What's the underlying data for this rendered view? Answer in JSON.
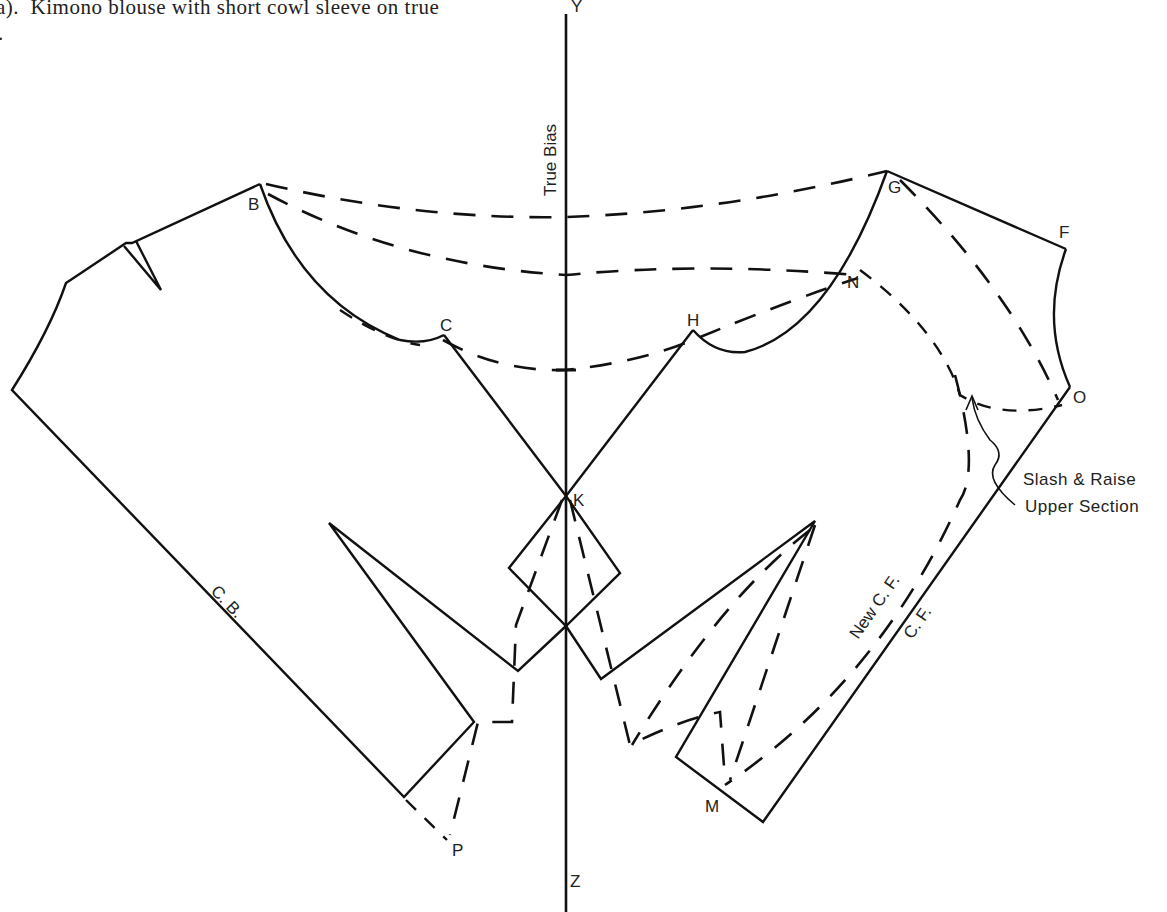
{
  "caption": {
    "line1": "a).  Kimono blouse with short cowl sleeve on true",
    "line2": "."
  },
  "axis": {
    "top_label": "Y",
    "bottom_label": "Z",
    "bias_label": "True  Bias"
  },
  "points": {
    "B": "B",
    "C": "C",
    "H": "H",
    "G": "G",
    "F": "F",
    "N": "N",
    "O": "O",
    "K": "K",
    "M": "M",
    "P": "P"
  },
  "edge_labels": {
    "center_back": "C. B.",
    "center_front": "C. F.",
    "new_center_front": "New  C. F."
  },
  "annotation": {
    "line1": "Slash  &  Raise",
    "line2": "Upper  Section"
  }
}
